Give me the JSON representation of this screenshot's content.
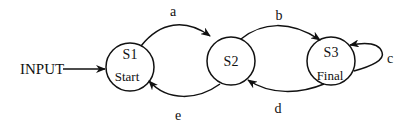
{
  "diagram": {
    "type": "state-machine",
    "input_label": "INPUT",
    "states": [
      {
        "id": "S1",
        "name": "S1",
        "sublabel": "Start"
      },
      {
        "id": "S2",
        "name": "S2",
        "sublabel": ""
      },
      {
        "id": "S3",
        "name": "S3",
        "sublabel": "Final"
      }
    ],
    "transitions": [
      {
        "from": "S1",
        "to": "S2",
        "label": "a"
      },
      {
        "from": "S2",
        "to": "S3",
        "label": "b"
      },
      {
        "from": "S3",
        "to": "S3",
        "label": "c"
      },
      {
        "from": "S3",
        "to": "S2",
        "label": "d"
      },
      {
        "from": "S2",
        "to": "S1",
        "label": "e"
      }
    ],
    "colors": {
      "stroke": "#111111",
      "background": "#ffffff"
    }
  }
}
